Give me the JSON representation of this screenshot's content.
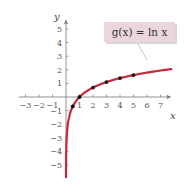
{
  "chart_data": {
    "type": "line",
    "title": "",
    "xlabel": "x",
    "ylabel": "y",
    "xlim": [
      -3.5,
      7.8
    ],
    "ylim": [
      -5.8,
      5.7
    ],
    "grid": false,
    "x_ticks": [
      -3,
      -2,
      -1,
      1,
      2,
      3,
      4,
      5,
      6,
      7
    ],
    "y_ticks": [
      -5,
      -4,
      -3,
      -2,
      -1,
      1,
      2,
      3,
      4,
      5
    ],
    "series": [
      {
        "name": "g(x) = ln x",
        "function": "ln(x)",
        "color": "#c8283a",
        "domain": [
          0.004,
          7.8
        ]
      }
    ],
    "points": [
      {
        "x": 0.5,
        "y": -0.69
      },
      {
        "x": 1,
        "y": 0
      },
      {
        "x": 2,
        "y": 0.69
      },
      {
        "x": 3,
        "y": 1.1
      },
      {
        "x": 4,
        "y": 1.39
      },
      {
        "x": 5,
        "y": 1.61
      }
    ],
    "annotation": {
      "text": "g(x) = ln x",
      "box_color": "#ecd6dc"
    }
  },
  "labels": {
    "x_axis": "x",
    "y_axis": "y",
    "function_label": "g(x) = ln x"
  }
}
